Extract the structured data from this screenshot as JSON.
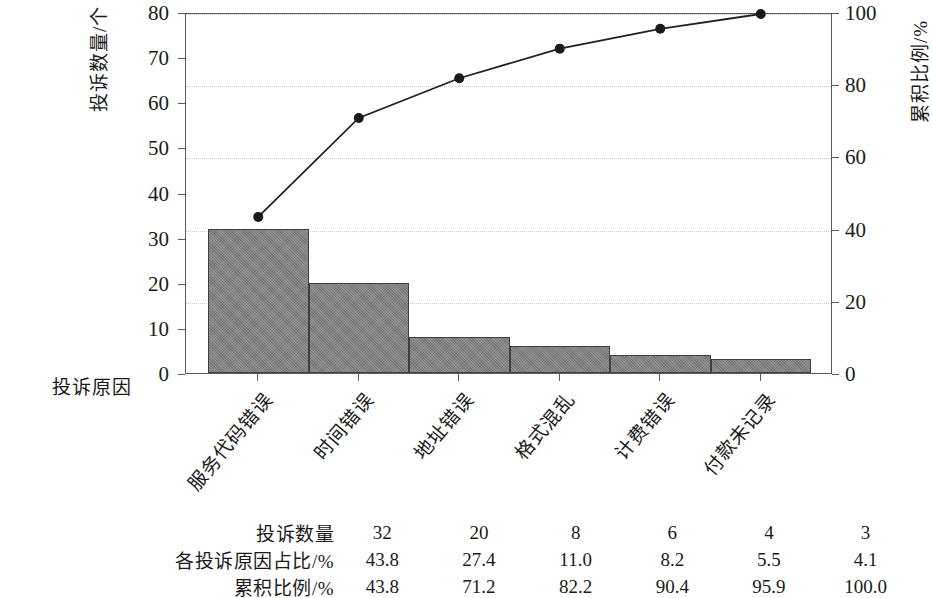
{
  "axes": {
    "x_title": "投诉原因",
    "y_left_title": "投诉数量/个",
    "y_right_title": "累积比例/%",
    "y_left_ticks": [
      "0",
      "10",
      "20",
      "30",
      "40",
      "50",
      "60",
      "70",
      "80"
    ],
    "y_right_ticks": [
      "0",
      "20",
      "40",
      "60",
      "80",
      "100"
    ]
  },
  "table": {
    "rows": [
      {
        "label": "投诉数量",
        "values": [
          "32",
          "20",
          "8",
          "6",
          "4",
          "3"
        ]
      },
      {
        "label": "各投诉原因占比/%",
        "values": [
          "43.8",
          "27.4",
          "11.0",
          "8.2",
          "5.5",
          "4.1"
        ]
      },
      {
        "label": "累积比例/%",
        "values": [
          "43.8",
          "71.2",
          "82.2",
          "90.4",
          "95.9",
          "100.0"
        ]
      }
    ]
  },
  "chart_data": {
    "type": "bar",
    "subtype": "pareto",
    "title": "",
    "xlabel": "投诉原因",
    "ylabel": "投诉数量/个",
    "y2label": "累积比例/%",
    "categories": [
      "服务代码错误",
      "时间错误",
      "地址错误",
      "格式混乱",
      "计费错误",
      "付款未记录"
    ],
    "values": [
      32,
      20,
      8,
      6,
      4,
      3
    ],
    "percent": [
      43.8,
      27.4,
      11.0,
      8.2,
      5.5,
      4.1
    ],
    "cumulative": [
      43.8,
      71.2,
      82.2,
      90.4,
      95.9,
      100.0
    ],
    "ylim": [
      0,
      80
    ],
    "y2lim": [
      0,
      100
    ],
    "ytick_step": 10,
    "y2tick_step": 20,
    "grid": true,
    "gridline_axis": "right",
    "legend": "none",
    "bar_color": "#808080",
    "bar_edge_color": "#3f3f3f",
    "line_color": "#222222",
    "marker": "circle",
    "marker_color": "#1a1a1a"
  }
}
